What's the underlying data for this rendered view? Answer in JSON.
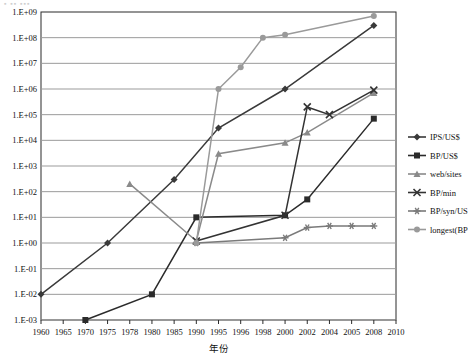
{
  "chart_data": {
    "type": "line",
    "title": "",
    "xlabel": "年份",
    "ylabel": "",
    "log_y": true,
    "ylim": [
      0.001,
      1000000000
    ],
    "grid": true,
    "legend_position": "right",
    "categories": [
      "1960",
      "1965",
      "1970",
      "1975",
      "1978",
      "1980",
      "1985",
      "1990",
      "1995",
      "1996",
      "1998",
      "2000",
      "2002",
      "2004",
      "2005",
      "2008",
      "2010"
    ],
    "ytick_labels": [
      "1.E+09",
      "1.E+08",
      "1.E+07",
      "1.E+06",
      "1.E+05",
      "1.E+04",
      "1.E+03",
      "1.E+02",
      "1.E+01",
      "1.E+00",
      "1.E-01",
      "1.E-02",
      "1.E-03"
    ],
    "ytick_values": [
      1000000000,
      100000000,
      10000000,
      1000000,
      100000,
      10000,
      1000,
      100,
      10,
      1,
      0.1,
      0.01,
      0.001
    ],
    "series": [
      {
        "name": "IPS/US$",
        "color": "#3a3a3a",
        "marker": "diamond",
        "points": [
          {
            "x": "1960",
            "y": 0.01
          },
          {
            "x": "1975",
            "y": 1.0
          },
          {
            "x": "1985",
            "y": 300
          },
          {
            "x": "1995",
            "y": 30000
          },
          {
            "x": "2000",
            "y": 1000000
          },
          {
            "x": "2008",
            "y": 300000000
          }
        ]
      },
      {
        "name": "BP/US$",
        "color": "#2b2b2b",
        "marker": "square",
        "points": [
          {
            "x": "1970",
            "y": 0.001
          },
          {
            "x": "1980",
            "y": 0.01
          },
          {
            "x": "1990",
            "y": 10
          },
          {
            "x": "2000",
            "y": 12
          },
          {
            "x": "2002",
            "y": 50
          },
          {
            "x": "2008",
            "y": 70000
          }
        ]
      },
      {
        "name": "web/sites",
        "color": "#8a8a8a",
        "marker": "triangle",
        "points": [
          {
            "x": "1978",
            "y": 200
          },
          {
            "x": "1990",
            "y": 1.2
          },
          {
            "x": "1995",
            "y": 3000
          },
          {
            "x": "2000",
            "y": 8000
          },
          {
            "x": "2002",
            "y": 20000
          },
          {
            "x": "2008",
            "y": 700000
          }
        ]
      },
      {
        "name": "BP/min",
        "color": "#333333",
        "marker": "x",
        "points": [
          {
            "x": "1990",
            "y": 1.2
          },
          {
            "x": "2000",
            "y": 12
          },
          {
            "x": "2002",
            "y": 200000
          },
          {
            "x": "2004",
            "y": 100000
          },
          {
            "x": "2008",
            "y": 900000
          }
        ]
      },
      {
        "name": "BP/syn/US",
        "color": "#7a7a7a",
        "marker": "star",
        "points": [
          {
            "x": "1990",
            "y": 1.0
          },
          {
            "x": "2000",
            "y": 1.6
          },
          {
            "x": "2002",
            "y": 4.0
          },
          {
            "x": "2004",
            "y": 4.6
          },
          {
            "x": "2005",
            "y": 4.6
          },
          {
            "x": "2008",
            "y": 4.6
          }
        ]
      },
      {
        "name": "longest(BP",
        "color": "#9a9a9a",
        "marker": "circle",
        "points": [
          {
            "x": "1990",
            "y": 1.0
          },
          {
            "x": "1995",
            "y": 1000000
          },
          {
            "x": "1996",
            "y": 7000000
          },
          {
            "x": "1998",
            "y": 100000000
          },
          {
            "x": "2000",
            "y": 130000000
          },
          {
            "x": "2008",
            "y": 700000000
          }
        ]
      }
    ]
  },
  "legend": {
    "items": [
      {
        "label": "IPS/US$"
      },
      {
        "label": "BP/US$"
      },
      {
        "label": "web/sites"
      },
      {
        "label": "BP/min"
      },
      {
        "label": "BP/syn/US"
      },
      {
        "label": "longest(BP"
      }
    ]
  },
  "axes": {
    "x_title": "年份"
  }
}
